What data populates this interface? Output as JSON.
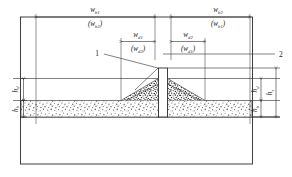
{
  "figure": {
    "type": "engineering-cross-section",
    "colors": {
      "line": "#2b2b2b",
      "label": "#1a1a1a",
      "background": "#ffffff",
      "sediment": "#8a8a8a"
    }
  },
  "dimensions": {
    "outer_left": {
      "primary_symbol": "w",
      "primary_subscript": "b1",
      "alternate_symbol": "w",
      "alternate_subscript": "b2",
      "alternate_open": "(",
      "alternate_close": ")"
    },
    "outer_right": {
      "primary_symbol": "w",
      "primary_subscript": "b2",
      "alternate_symbol": "w",
      "alternate_subscript": "b1",
      "alternate_open": "(",
      "alternate_close": ")"
    },
    "inner_left": {
      "primary_symbol": "w",
      "primary_subscript": "d1",
      "alternate_symbol": "w",
      "alternate_subscript": "d2",
      "alternate_open": "(",
      "alternate_close": ")"
    },
    "inner_right": {
      "primary_symbol": "w",
      "primary_subscript": "d2",
      "alternate_symbol": "w",
      "alternate_subscript": "d1",
      "alternate_open": "(",
      "alternate_close": ")"
    },
    "height_left_upper": {
      "symbol": "h",
      "subscript": "d"
    },
    "height_left_lower": {
      "symbol": "h",
      "subscript": "b"
    },
    "height_right_upper": {
      "symbol": "h",
      "subscript": "d"
    },
    "height_right_lower": {
      "symbol": "h",
      "subscript": "b"
    },
    "height_right_total": {
      "symbol": "h",
      "subscript": "s"
    }
  },
  "callouts": [
    {
      "id": "callout-1",
      "label": "1"
    },
    {
      "id": "callout-2",
      "label": "2"
    }
  ]
}
